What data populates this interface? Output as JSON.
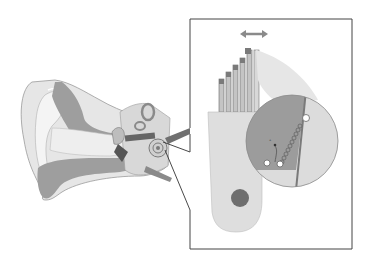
{
  "figure": {
    "labels": [],
    "regions": {
      "ear": "outer, middle and inner ear cross-section",
      "inset": "magnified hair cell with stereocilia bundle",
      "detail_circle": "tip-link / gating spring detail"
    },
    "annotations": {
      "motion_arrow": "bidirectional arrow indicating stereocilia deflection"
    }
  },
  "colors": {
    "background": "#ffffff",
    "light_gray": "#e4e4e4",
    "mid_gray": "#bdbdbd",
    "dark_gray": "#8a8a8a",
    "outline": "#555555",
    "nucleus": "#6e6e6e"
  }
}
